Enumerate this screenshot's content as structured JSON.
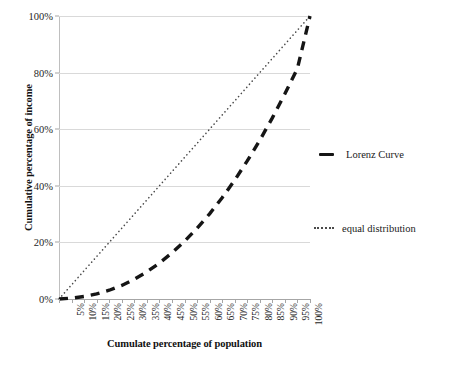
{
  "chart_data": {
    "type": "line",
    "title": "",
    "xlabel": "Cumulate percentage of population",
    "ylabel": "Cumulative percentage of income",
    "xlim": [
      0,
      100
    ],
    "ylim": [
      0,
      100
    ],
    "grid": true,
    "legend_position": "right",
    "y_ticks": [
      "0%",
      "20%",
      "40%",
      "60%",
      "80%",
      "100%"
    ],
    "y_tick_values": [
      0,
      20,
      40,
      60,
      80,
      100
    ],
    "x_ticks": [
      "",
      "5%",
      "10%",
      "15%",
      "20%",
      "25%",
      "30%",
      "35%",
      "40%",
      "45%",
      "50%",
      "55%",
      "60%",
      "65%",
      "70%",
      "75%",
      "80%",
      "85%",
      "90%",
      "95%",
      "100%"
    ],
    "x_tick_values": [
      0,
      5,
      10,
      15,
      20,
      25,
      30,
      35,
      40,
      45,
      50,
      55,
      60,
      65,
      70,
      75,
      80,
      85,
      90,
      95,
      100
    ],
    "series": [
      {
        "name": "Lorenz Curve",
        "style": "dashed",
        "color": "#151515",
        "x": [
          0,
          5,
          10,
          15,
          20,
          25,
          30,
          35,
          40,
          45,
          50,
          55,
          60,
          65,
          70,
          75,
          80,
          85,
          90,
          95,
          100
        ],
        "values": [
          0,
          0.3,
          0.9,
          1.8,
          3.1,
          4.8,
          7.0,
          9.6,
          12.7,
          16.3,
          20.4,
          25.0,
          30.1,
          35.8,
          42.0,
          48.8,
          56.1,
          64.0,
          72.5,
          81.5,
          100
        ]
      },
      {
        "name": "equal distribution",
        "style": "dotted",
        "color": "#4a4a4a",
        "x": [
          0,
          100
        ],
        "values": [
          0,
          100
        ]
      }
    ]
  },
  "legend": {
    "entries": [
      {
        "label": "Lorenz Curve",
        "style": "dashed"
      },
      {
        "label": "equal distribution",
        "style": "dotted"
      }
    ]
  },
  "colors": {
    "lorenz": "#151515",
    "equal": "#4a4a4a",
    "gridline": "#d9d9d9",
    "axis": "#a6a6a6",
    "text": "#1a1a1a",
    "background": "#ffffff"
  }
}
